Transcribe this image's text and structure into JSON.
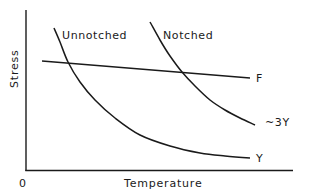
{
  "chart_data": {
    "type": "line",
    "title": "",
    "xlabel": "Temperature",
    "ylabel": "Stress",
    "x_origin_label": "0",
    "grid": false,
    "legend": "none (curves labelled directly)",
    "units": "qualitative (no numeric ticks)",
    "series": [
      {
        "name": "Unnotched",
        "curve_end_label": "Y",
        "description": "Yield stress of unnotched specimen; falls steeply with temperature then flattens",
        "points_px": [
          [
            54,
            28
          ],
          [
            60,
            42
          ],
          [
            68,
            62
          ],
          [
            80,
            82
          ],
          [
            95,
            100
          ],
          [
            115,
            118
          ],
          [
            140,
            135
          ],
          [
            170,
            146
          ],
          [
            200,
            153
          ],
          [
            225,
            156
          ],
          [
            250,
            158
          ]
        ]
      },
      {
        "name": "Notched",
        "curve_end_label": "~3Y",
        "description": "Notched yield stress, approximately 3 times unnotched yield stress",
        "points_px": [
          [
            150,
            22
          ],
          [
            160,
            40
          ],
          [
            170,
            56
          ],
          [
            182,
            72
          ],
          [
            195,
            86
          ],
          [
            210,
            100
          ],
          [
            225,
            110
          ],
          [
            240,
            118
          ],
          [
            255,
            125
          ]
        ]
      },
      {
        "name": "F",
        "curve_end_label": "F",
        "description": "Fracture stress, nearly constant, slowly decreasing with temperature",
        "points_px": [
          [
            42,
            61
          ],
          [
            250,
            78
          ]
        ]
      }
    ],
    "annotations": [
      {
        "text": "Unnotched",
        "near": "top of unnotched curve"
      },
      {
        "text": "Notched",
        "near": "top of notched curve"
      },
      {
        "text": "F",
        "near": "right end of fracture line"
      },
      {
        "text": "~3Y",
        "near": "right end of notched curve"
      },
      {
        "text": "Y",
        "near": "right end of unnotched curve"
      }
    ],
    "intersections": [
      {
        "curves": [
          "Unnotched",
          "F"
        ],
        "approx_px": [
          68,
          62
        ]
      },
      {
        "curves": [
          "Notched",
          "F"
        ],
        "approx_px": [
          182,
          72
        ]
      }
    ]
  },
  "labels": {
    "ylabel": "Stress",
    "xlabel": "Temperature",
    "origin": "0",
    "unnotched": "Unnotched",
    "notched": "Notched",
    "f": "F",
    "three_y": "~3Y",
    "y": "Y"
  },
  "colors": {
    "line": "#1a1a1a",
    "background": "#ffffff"
  }
}
